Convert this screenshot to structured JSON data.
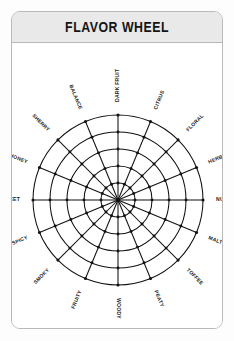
{
  "card": {
    "title": "FLAVOR WHEEL"
  },
  "chart_data": {
    "type": "radar",
    "title": "FLAVOR WHEEL",
    "grid": true,
    "legend": false,
    "rings": 5,
    "spokes": 16,
    "rmax": 5,
    "start_angle_deg": -90,
    "direction": "clockwise",
    "categories": [
      "DARK FRUIT",
      "CITRUS",
      "FLORAL",
      "HERBAL",
      "NUTTY",
      "MALTY",
      "TOFFEE",
      "PEATY",
      "WOODY",
      "FRUITY",
      "SMOKY",
      "SPICY",
      "SWEET",
      "HONEY",
      "SHERRY",
      "BALANCE"
    ],
    "series": [],
    "colors": {
      "grid": "#111111",
      "node": "#111111",
      "label": "#1a1a1a",
      "header_bg": "#e9e9e9",
      "card_border": "#b9b9b9",
      "card_bg": "#ffffff"
    }
  }
}
